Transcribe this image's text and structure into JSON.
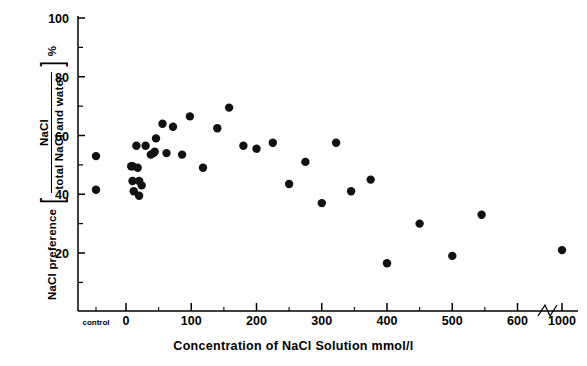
{
  "figure": {
    "axes": {
      "y": {
        "label_main": "NaCl preference",
        "label_numerator": "NaCl",
        "label_denominator": "total NaCl and water",
        "label_unit": "%",
        "ticks": [
          "100",
          "80",
          "60",
          "40",
          "20"
        ],
        "tick_values": [
          100,
          80,
          60,
          40,
          20
        ],
        "range": [
          0,
          100
        ]
      },
      "x": {
        "label": "Concentration of NaCl Solution  mmol/l",
        "ticks": [
          "control",
          "0",
          "100",
          "200",
          "300",
          "400",
          "500",
          "600",
          "1000"
        ],
        "break_marker": "//"
      }
    },
    "marker_color": "#111111"
  },
  "chart_data": {
    "type": "scatter",
    "title": "",
    "xlabel": "Concentration of NaCl Solution  mmol/l",
    "ylabel": "NaCl preference [NaCl / total NaCl and water] %",
    "ylim": [
      0,
      100
    ],
    "xlim": [
      -60,
      1050
    ],
    "grid": false,
    "legend": null,
    "x_tick_labels": [
      "control",
      "0",
      "100",
      "200",
      "300",
      "400",
      "500",
      "600",
      "1000"
    ],
    "x_tick_values": [
      -45,
      0,
      100,
      200,
      300,
      400,
      500,
      600,
      1000
    ],
    "y_tick_labels": [
      "100",
      "80",
      "60",
      "40",
      "20"
    ],
    "y_tick_values": [
      100,
      80,
      60,
      40,
      20
    ],
    "axis_break_between": [
      600,
      1000
    ],
    "series": [
      {
        "name": "NaCl preference",
        "points": [
          {
            "x": -45,
            "y": 53.0
          },
          {
            "x": -45,
            "y": 41.5
          },
          {
            "x": 8,
            "y": 49.5
          },
          {
            "x": 10,
            "y": 49.5
          },
          {
            "x": 10,
            "y": 44.5
          },
          {
            "x": 12,
            "y": 41.0
          },
          {
            "x": 16,
            "y": 56.5
          },
          {
            "x": 18,
            "y": 49.0
          },
          {
            "x": 20,
            "y": 44.5
          },
          {
            "x": 20,
            "y": 39.5
          },
          {
            "x": 24,
            "y": 43.0
          },
          {
            "x": 30,
            "y": 56.5
          },
          {
            "x": 38,
            "y": 53.5
          },
          {
            "x": 42,
            "y": 54.0
          },
          {
            "x": 44,
            "y": 54.5
          },
          {
            "x": 46,
            "y": 59.0
          },
          {
            "x": 56,
            "y": 64.0
          },
          {
            "x": 62,
            "y": 54.0
          },
          {
            "x": 72,
            "y": 63.0
          },
          {
            "x": 86,
            "y": 53.5
          },
          {
            "x": 98,
            "y": 66.5
          },
          {
            "x": 118,
            "y": 49.0
          },
          {
            "x": 140,
            "y": 62.5
          },
          {
            "x": 158,
            "y": 69.5
          },
          {
            "x": 180,
            "y": 56.5
          },
          {
            "x": 200,
            "y": 55.5
          },
          {
            "x": 225,
            "y": 57.5
          },
          {
            "x": 250,
            "y": 43.5
          },
          {
            "x": 275,
            "y": 51.0
          },
          {
            "x": 300,
            "y": 37.0
          },
          {
            "x": 322,
            "y": 57.5
          },
          {
            "x": 345,
            "y": 41.0
          },
          {
            "x": 375,
            "y": 45.0
          },
          {
            "x": 400,
            "y": 16.5
          },
          {
            "x": 450,
            "y": 30.0
          },
          {
            "x": 500,
            "y": 19.0
          },
          {
            "x": 545,
            "y": 33.0
          },
          {
            "x": 1000,
            "y": 21.0
          }
        ]
      }
    ]
  }
}
